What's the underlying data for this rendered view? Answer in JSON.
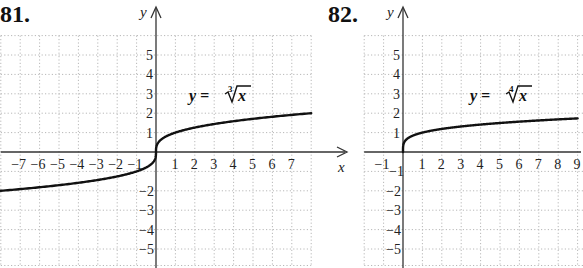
{
  "chart_data": [
    {
      "problem_label": "81.",
      "type": "line",
      "title": "y = ∛x",
      "equation": "y = ∛x",
      "root_index": "3",
      "function": "cube root",
      "xlabel": "x",
      "ylabel": "y",
      "x_ticks": [
        "-7",
        "-6",
        "-5",
        "-4",
        "-3",
        "-2",
        "-1",
        "1",
        "2",
        "3",
        "4",
        "5",
        "6",
        "7"
      ],
      "y_ticks": [
        "5",
        "4",
        "3",
        "2",
        "1",
        "-2",
        "-3",
        "-4",
        "-5"
      ],
      "xlim": [
        -8,
        8
      ],
      "ylim": [
        -5.8,
        6
      ],
      "grid": true,
      "series": [
        {
          "name": "y = ∛x",
          "x": [
            -8,
            -7,
            -6,
            -5,
            -4,
            -3,
            -2,
            -1,
            -0.5,
            -0.125,
            0,
            0.125,
            0.5,
            1,
            2,
            3,
            4,
            5,
            6,
            7,
            8
          ],
          "y": [
            -2,
            -1.913,
            -1.817,
            -1.71,
            -1.587,
            -1.442,
            -1.26,
            -1,
            -0.794,
            -0.5,
            0,
            0.5,
            0.794,
            1,
            1.26,
            1.442,
            1.587,
            1.71,
            1.817,
            1.913,
            2
          ]
        }
      ]
    },
    {
      "problem_label": "82.",
      "type": "line",
      "title": "y = ∜x",
      "equation": "y = ∜x",
      "root_index": "4",
      "function": "fourth root",
      "xlabel": "x",
      "ylabel": "y",
      "x_ticks": [
        "-1",
        "1",
        "2",
        "3",
        "4",
        "5",
        "6",
        "7",
        "8",
        "9"
      ],
      "y_ticks": [
        "5",
        "4",
        "3",
        "2",
        "1",
        "-1",
        "-2",
        "-3",
        "-4",
        "-5"
      ],
      "xlim": [
        -2,
        9.3
      ],
      "ylim": [
        -5.8,
        6
      ],
      "grid": true,
      "series": [
        {
          "name": "y = ∜x",
          "x": [
            0,
            0.0625,
            0.25,
            1,
            2,
            3,
            4,
            5,
            6,
            7,
            8,
            9
          ],
          "y": [
            0,
            0.5,
            0.707,
            1,
            1.189,
            1.316,
            1.414,
            1.495,
            1.565,
            1.627,
            1.682,
            1.732
          ]
        }
      ]
    }
  ],
  "labels": {
    "left_problem": "81.",
    "right_problem": "82.",
    "y_axis": "y",
    "x_axis": "x",
    "left_eq_lhs": "y = ",
    "left_eq_rad": "x",
    "left_eq_index": "3",
    "right_eq_lhs": "y = ",
    "right_eq_rad": "x",
    "right_eq_index": "4"
  }
}
